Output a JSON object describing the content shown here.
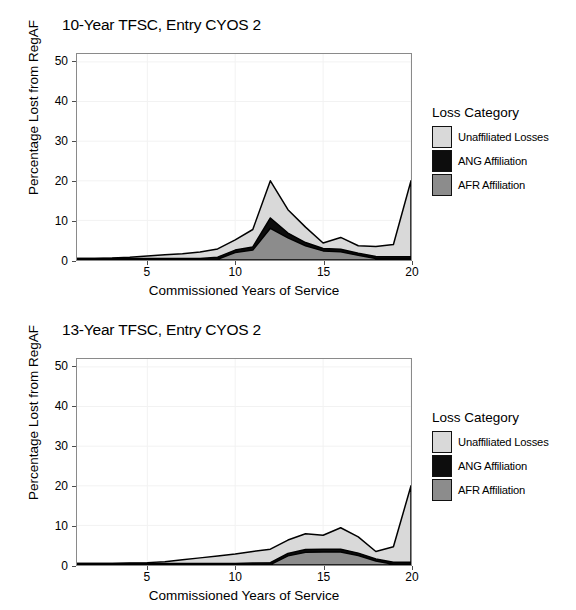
{
  "figure": {
    "width": 576,
    "height": 610,
    "background": "#ffffff"
  },
  "colors": {
    "unaffiliated": "#d9d9d9",
    "ang": "#0d0d0d",
    "afr": "#8c8c8c",
    "outline": "#000000",
    "panel_border": "#8a8a8a",
    "gridline": "#f2f2f2",
    "tick": "#4d4d4d"
  },
  "legend": {
    "title": "Loss Category",
    "items": [
      {
        "label": "Unaffiliated Losses",
        "color": "#d9d9d9",
        "swatch_name": "legend-swatch-unaffiliated"
      },
      {
        "label": "ANG Affiliation",
        "color": "#0d0d0d",
        "swatch_name": "legend-swatch-ang"
      },
      {
        "label": "AFR Affiliation",
        "color": "#8c8c8c",
        "swatch_name": "legend-swatch-afr"
      }
    ]
  },
  "chart_data": [
    {
      "id": "chart-10-year",
      "type": "area",
      "stacked": true,
      "title": "10-Year TFSC, Entry CYOS 2",
      "xlabel": "Commissioned Years of Service",
      "ylabel": "Percentage Lost from RegAF",
      "xlim": [
        1,
        20
      ],
      "ylim": [
        0,
        52
      ],
      "xticks": [
        5,
        10,
        15,
        20
      ],
      "yticks": [
        0,
        10,
        20,
        30,
        40,
        50
      ],
      "grid": true,
      "legend_position": "right",
      "x": [
        1,
        2,
        3,
        4,
        5,
        6,
        7,
        8,
        9,
        10,
        11,
        12,
        13,
        14,
        15,
        16,
        17,
        18,
        19,
        20
      ],
      "series": [
        {
          "name": "AFR Affiliation",
          "color": "#8c8c8c",
          "values": [
            0.0,
            0.0,
            0.0,
            0.0,
            0.0,
            0.0,
            0.0,
            0.0,
            0.2,
            1.9,
            2.5,
            8.0,
            5.6,
            3.6,
            2.3,
            2.1,
            1.2,
            0.4,
            0.3,
            0.3
          ]
        },
        {
          "name": "ANG Affiliation",
          "color": "#0d0d0d",
          "values": [
            0.4,
            0.4,
            0.4,
            0.4,
            0.4,
            0.4,
            0.4,
            0.4,
            0.5,
            0.6,
            0.8,
            2.6,
            1.2,
            0.8,
            0.6,
            0.6,
            0.5,
            0.5,
            0.5,
            0.5
          ]
        },
        {
          "name": "Unaffiliated Losses",
          "color": "#d9d9d9",
          "values": [
            0.0,
            0.0,
            0.1,
            0.3,
            0.6,
            0.9,
            1.2,
            1.6,
            2.1,
            2.6,
            4.4,
            9.4,
            5.9,
            3.9,
            1.4,
            3.0,
            1.9,
            2.5,
            3.1,
            19.2
          ]
        }
      ],
      "totals": [
        0.4,
        0.4,
        0.5,
        0.7,
        1.0,
        1.3,
        1.6,
        2.0,
        2.8,
        5.1,
        7.7,
        20.0,
        12.7,
        8.3,
        4.3,
        5.7,
        3.6,
        3.4,
        3.9,
        20.0
      ],
      "annotations": [
        {
          "text": "peak at CYOS 12",
          "value": 20.0
        },
        {
          "text": "spike at CYOS 20",
          "value": 20.0
        }
      ]
    },
    {
      "id": "chart-13-year",
      "type": "area",
      "stacked": true,
      "title": "13-Year TFSC, Entry CYOS 2",
      "xlabel": "Commissioned Years of Service",
      "ylabel": "Percentage Lost from RegAF",
      "xlim": [
        1,
        20
      ],
      "ylim": [
        0,
        52
      ],
      "xticks": [
        5,
        10,
        15,
        20
      ],
      "yticks": [
        0,
        10,
        20,
        30,
        40,
        50
      ],
      "grid": true,
      "legend_position": "right",
      "x": [
        1,
        2,
        3,
        4,
        5,
        6,
        7,
        8,
        9,
        10,
        11,
        12,
        13,
        14,
        15,
        16,
        17,
        18,
        19,
        20
      ],
      "series": [
        {
          "name": "AFR Affiliation",
          "color": "#8c8c8c",
          "values": [
            0.0,
            0.0,
            0.0,
            0.0,
            0.0,
            0.0,
            0.0,
            0.0,
            0.0,
            0.0,
            0.0,
            0.1,
            2.3,
            3.2,
            3.3,
            3.3,
            2.4,
            1.0,
            0.2,
            0.2
          ]
        },
        {
          "name": "ANG Affiliation",
          "color": "#0d0d0d",
          "values": [
            0.4,
            0.4,
            0.4,
            0.4,
            0.4,
            0.4,
            0.4,
            0.4,
            0.4,
            0.4,
            0.5,
            0.5,
            0.6,
            0.7,
            0.7,
            0.7,
            0.6,
            0.5,
            0.5,
            0.5
          ]
        },
        {
          "name": "Unaffiliated Losses",
          "color": "#d9d9d9",
          "values": [
            0.0,
            0.0,
            0.0,
            0.1,
            0.2,
            0.4,
            0.9,
            1.4,
            1.9,
            2.4,
            2.9,
            3.4,
            3.4,
            4.0,
            3.5,
            5.4,
            4.1,
            1.9,
            3.9,
            19.3
          ]
        }
      ],
      "totals": [
        0.4,
        0.4,
        0.4,
        0.5,
        0.6,
        0.8,
        1.3,
        1.8,
        2.3,
        2.8,
        3.4,
        4.0,
        6.3,
        7.9,
        7.5,
        9.4,
        7.1,
        3.4,
        4.6,
        20.0
      ],
      "annotations": [
        {
          "text": "local peak at CYOS 16",
          "value": 9.4
        },
        {
          "text": "spike at CYOS 20",
          "value": 20.0
        }
      ]
    }
  ]
}
